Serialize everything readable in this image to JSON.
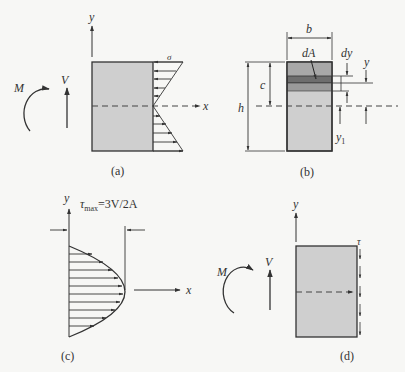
{
  "figure": {
    "panels": [
      {
        "id": "a",
        "caption": "(a)",
        "labels": {
          "y_axis": "y",
          "x_axis": "x",
          "stress": "σ",
          "moment": "M",
          "shear": "V"
        }
      },
      {
        "id": "b",
        "caption": "(b)",
        "labels": {
          "width": "b",
          "area_element": "dA",
          "strip_height": "dy",
          "distance_y": "y",
          "distance_c": "c",
          "height": "h",
          "distance_y1": "y",
          "distance_y1_sub": "1"
        }
      },
      {
        "id": "c",
        "caption": "(c)",
        "labels": {
          "y_axis": "y",
          "x_axis": "x",
          "tau": "τ",
          "tau_sub": "max",
          "formula": "=3V/2A"
        }
      },
      {
        "id": "d",
        "caption": "(d)",
        "labels": {
          "y_axis": "y",
          "tau": "τ",
          "moment": "M",
          "shear": "V"
        }
      }
    ],
    "colors": {
      "background": "#f7f7f5",
      "section_fill": "#cfcfcf",
      "band_top": "#a8a8a8",
      "band_dark": "#6e6e6e",
      "band_mid": "#9a9a9a",
      "line": "#333333"
    }
  }
}
